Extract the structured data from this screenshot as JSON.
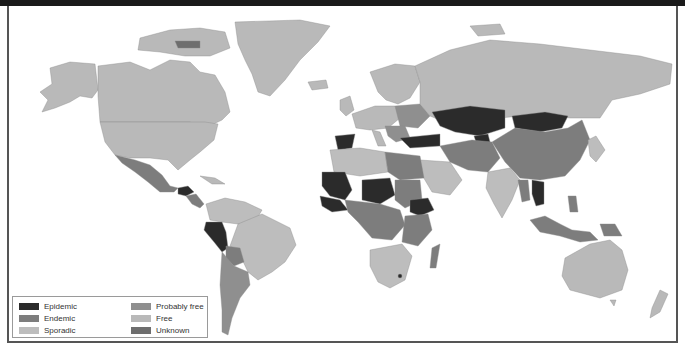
{
  "map": {
    "title": "",
    "projection": "world",
    "categories": {
      "epidemic": {
        "label": "Epidemic",
        "color": "#2b2b2b"
      },
      "endemic": {
        "label": "Endemic",
        "color": "#7d7d7d"
      },
      "sporadic": {
        "label": "Sporadic",
        "color": "#bdbdbd"
      },
      "probably_free": {
        "label": "Probably free",
        "color": "#8f8f8f"
      },
      "free": {
        "label": "Free",
        "color": "#b9b9b9"
      },
      "unknown": {
        "label": "Unknown",
        "color": "#6e6e6e"
      }
    },
    "regions": {
      "epidemic": [
        "Spain",
        "Turkey",
        "Kazakhstan",
        "Mongolia",
        "Kyrgyzstan",
        "Mauritania",
        "Mali",
        "Niger",
        "Chad",
        "Senegal",
        "Guinea",
        "Sierra Leone",
        "Liberia",
        "Ethiopia",
        "Peru",
        "Guatemala",
        "Honduras",
        "Cambodia",
        "Vietnam",
        "Lesotho"
      ],
      "endemic": [
        "China",
        "Iran",
        "Afghanistan",
        "Pakistan",
        "Central Asia",
        "Sudan",
        "Egypt",
        "Libya",
        "Central Africa",
        "East Africa",
        "Madagascar",
        "Mexico",
        "Bolivia",
        "Argentina",
        "Indonesia",
        "Papua New Guinea",
        "Myanmar"
      ],
      "sporadic": [
        "India",
        "Saudi Arabia",
        "Brazil",
        "Colombia",
        "Venezuela",
        "Southern Africa",
        "Algeria",
        "Morocco",
        "Japan",
        "Korea"
      ],
      "probably_free": [
        "Balkans",
        "Eastern Europe"
      ],
      "free": [
        "Canada",
        "United States",
        "Greenland",
        "Russia",
        "Western Europe",
        "Scandinavia",
        "Australia",
        "New Zealand",
        "Alaska"
      ],
      "unknown": [
        "Arctic island (Canada)"
      ]
    }
  },
  "legend": {
    "items": [
      {
        "label": "Epidemic",
        "color": "#2b2b2b"
      },
      {
        "label": "Endemic",
        "color": "#7d7d7d"
      },
      {
        "label": "Sporadic",
        "color": "#bdbdbd"
      },
      {
        "label": "Probably free",
        "color": "#8f8f8f"
      },
      {
        "label": "Free",
        "color": "#b9b9b9"
      },
      {
        "label": "Unknown",
        "color": "#6e6e6e"
      }
    ]
  }
}
